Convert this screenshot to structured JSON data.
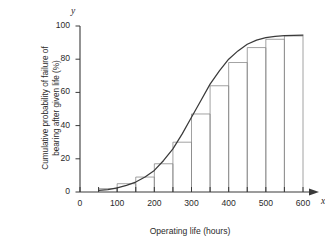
{
  "chart_data": {
    "type": "bar",
    "title": "",
    "subtitle": "",
    "xlabel": "Operating life (hours)",
    "ylabel": "Cumulative probability of failure of bearing after given life (%)",
    "ylabel_line1": "Cumulative probability of failure of",
    "ylabel_line2": "bearing after given life (%)",
    "x_axis_letter": "x",
    "y_axis_letter": "y",
    "xlim": [
      0,
      600
    ],
    "ylim": [
      0,
      100
    ],
    "xticks": [
      0,
      50,
      100,
      150,
      200,
      250,
      300,
      350,
      400,
      450,
      500,
      550,
      600
    ],
    "xtick_labels": [
      "0",
      "",
      "100",
      "",
      "200",
      "",
      "300",
      "",
      "400",
      "",
      "500",
      "",
      "600"
    ],
    "yticks": [
      0,
      20,
      40,
      60,
      80,
      100
    ],
    "ytick_labels": [
      "0",
      "20",
      "40",
      "60",
      "80",
      "100"
    ],
    "grid": false,
    "legend": "none",
    "bar_width": 50,
    "categories": [
      "50-100",
      "100-150",
      "150-200",
      "200-250",
      "250-300",
      "300-350",
      "350-400",
      "400-450",
      "450-500",
      "500-550",
      "550-600"
    ],
    "bar_left_edges": [
      50,
      100,
      150,
      200,
      250,
      300,
      350,
      400,
      450,
      500,
      550
    ],
    "values": [
      2,
      5,
      9,
      17,
      30,
      47,
      64,
      78,
      87,
      92,
      94
    ],
    "series": [
      {
        "name": "Cumulative failure histogram",
        "values": [
          2,
          5,
          9,
          17,
          30,
          47,
          64,
          78,
          87,
          92,
          94
        ]
      },
      {
        "name": "Fitted ogive curve",
        "type": "line",
        "x": [
          50,
          75,
          100,
          125,
          150,
          175,
          200,
          225,
          250,
          275,
          300,
          325,
          350,
          375,
          400,
          425,
          450,
          475,
          500,
          525,
          550,
          575,
          600
        ],
        "y": [
          1,
          1.5,
          2.5,
          4,
          6,
          9,
          13,
          19,
          26,
          35,
          45,
          55,
          65,
          73,
          80,
          85,
          89,
          91.5,
          93,
          93.8,
          94.2,
          94.4,
          94.5
        ]
      }
    ],
    "colors": {
      "axis": "#3a3a3a",
      "bar_stroke": "#8a8a8a",
      "bar_fill": "none",
      "curve": "#3a3a3a",
      "text": "#2b2b2b",
      "background": "#ffffff"
    }
  }
}
